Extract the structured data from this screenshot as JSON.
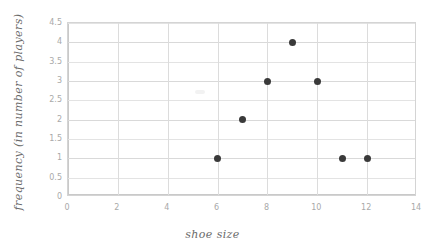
{
  "chart_data": {
    "type": "scatter",
    "title": "",
    "xlabel": "shoe size",
    "ylabel": "frequency (in number of players)",
    "xlim": [
      0,
      14
    ],
    "ylim": [
      0,
      4.5
    ],
    "xticks": [
      "0",
      "2",
      "4",
      "6",
      "8",
      "10",
      "12",
      "14"
    ],
    "xtick_values": [
      0,
      2,
      4,
      6,
      8,
      10,
      12,
      14
    ],
    "yticks": [
      "0",
      "0.5",
      "1",
      "1.5",
      "2",
      "2.5",
      "3",
      "3.5",
      "4",
      "4.5"
    ],
    "ytick_values": [
      0,
      0.5,
      1,
      1.5,
      2,
      2.5,
      3,
      3.5,
      4,
      4.5
    ],
    "grid": true,
    "legend": "none",
    "x": [
      6,
      7,
      8,
      9,
      10,
      11,
      12
    ],
    "y": [
      1,
      2,
      3,
      4,
      3,
      1,
      1
    ],
    "points": [
      {
        "x": 6,
        "y": 1
      },
      {
        "x": 7,
        "y": 2
      },
      {
        "x": 8,
        "y": 3
      },
      {
        "x": 9,
        "y": 4
      },
      {
        "x": 10,
        "y": 3
      },
      {
        "x": 11,
        "y": 1
      },
      {
        "x": 12,
        "y": 1
      }
    ],
    "marker_color": "#3a3a3a",
    "grid_color": "#e3e3e3",
    "axis_color": "#c9c9c9",
    "tick_label_color": "#a9a9a9",
    "axis_title_color": "#6a6a6a",
    "background": "#ffffff"
  }
}
